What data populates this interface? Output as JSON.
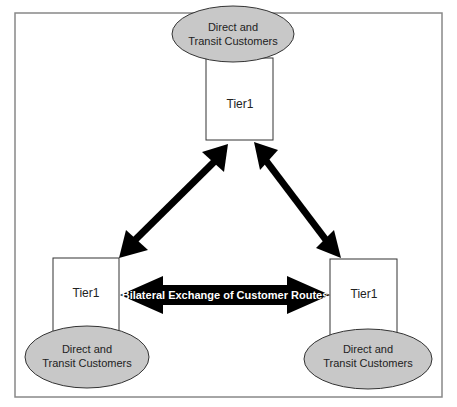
{
  "diagram": {
    "frame_color": "#888888",
    "ellipse_fill": "#c8c8c8",
    "arrow_color": "#000000",
    "nodes": [
      {
        "label": "Tier1",
        "customers_line1": "Direct and",
        "customers_line2": "Transit Customers"
      },
      {
        "label": "Tier1",
        "customers_line1": "Direct and",
        "customers_line2": "Transit Customers"
      },
      {
        "label": "Tier1",
        "customers_line1": "Direct and",
        "customers_line2": "Transit Customers"
      }
    ],
    "edges": [
      {
        "from": "top",
        "to": "bottom-left",
        "type": "bidirectional"
      },
      {
        "from": "top",
        "to": "bottom-right",
        "type": "bidirectional"
      },
      {
        "from": "bottom-left",
        "to": "bottom-right",
        "type": "bidirectional",
        "label": "Bilateral Exchange of Customer Routes"
      }
    ]
  }
}
